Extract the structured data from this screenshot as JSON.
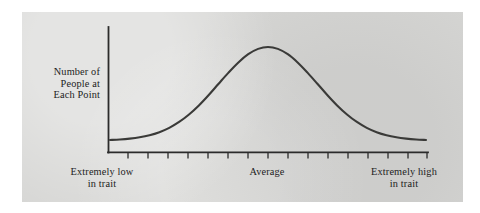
{
  "figure": {
    "name": "normal-distribution-trait-curve",
    "panel_color": "#d6d6d4",
    "page_color": "#ffffff",
    "curve_color": "#3a3a38",
    "axis_color": "#2b2b2b",
    "text_color": "#1c1c1c"
  },
  "axes": {
    "y_label": {
      "line1": "Number of",
      "line2": "People at",
      "line3": "Each Point"
    },
    "x_labels": {
      "low": {
        "line1": "Extremely low",
        "line2": "in trait"
      },
      "center": {
        "line1": "Average",
        "line2": ""
      },
      "high": {
        "line1": "Extremely high",
        "line2": "in trait"
      }
    },
    "tick_count": 16,
    "x_axis_shown": true,
    "y_axis_shown": true,
    "grid": false
  },
  "chart_data": {
    "type": "line",
    "title": "",
    "subtitle": "",
    "xlabel": "Trait level",
    "ylabel": "Number of People at Each Point",
    "distribution": "normal",
    "legend": [],
    "legend_position": "none",
    "grid": false,
    "xlim": [
      -3.2,
      3.2
    ],
    "ylim": [
      0,
      1.08
    ],
    "x_tick_labels": [
      "Extremely low in trait",
      "Average",
      "Extremely high in trait"
    ],
    "x_tick_label_positions": [
      -2.5,
      0,
      2.5
    ],
    "y_tick_labels": [],
    "annotations": [],
    "series": [
      {
        "name": "Distribution of trait in population",
        "x": [
          -3.2,
          -3.0,
          -2.8,
          -2.6,
          -2.4,
          -2.2,
          -2.0,
          -1.8,
          -1.6,
          -1.4,
          -1.2,
          -1.0,
          -0.8,
          -0.6,
          -0.4,
          -0.2,
          0.0,
          0.2,
          0.4,
          0.6,
          0.8,
          1.0,
          1.2,
          1.4,
          1.6,
          1.8,
          2.0,
          2.2,
          2.4,
          2.6,
          2.8,
          3.0,
          3.2
        ],
        "values": [
          0.006,
          0.011,
          0.02,
          0.034,
          0.056,
          0.089,
          0.135,
          0.198,
          0.278,
          0.375,
          0.487,
          0.607,
          0.726,
          0.835,
          0.923,
          0.98,
          1.0,
          0.98,
          0.923,
          0.835,
          0.726,
          0.607,
          0.487,
          0.375,
          0.278,
          0.198,
          0.135,
          0.089,
          0.056,
          0.034,
          0.02,
          0.011,
          0.006
        ]
      }
    ],
    "peak": {
      "x": 0.0,
      "y": 1.0,
      "label": "Average"
    }
  }
}
